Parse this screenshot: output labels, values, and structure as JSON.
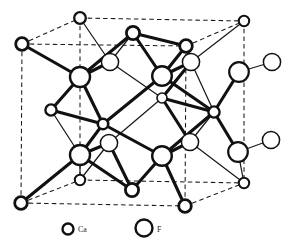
{
  "figure": {
    "background_color": "#ffffff",
    "line_color": "#1a1a1a",
    "cell_edge_style": "dashed"
  },
  "legend": {
    "items": [
      {
        "symbol": "Ca",
        "label": "Ca",
        "marker": "small-open-circle",
        "radius": 5.5,
        "stroke_width": 2.4
      },
      {
        "symbol": "F",
        "label": "F",
        "marker": "large-open-circle",
        "radius": 8.5,
        "stroke_width": 2.4
      }
    ]
  },
  "structure": {
    "cell_corners": {
      "back_top_left": {
        "x": 80,
        "y": 18
      },
      "back_top_right": {
        "x": 244,
        "y": 21
      },
      "back_bot_left": {
        "x": 80,
        "y": 180
      },
      "back_bot_right": {
        "x": 244,
        "y": 183
      },
      "front_top_left": {
        "x": 22,
        "y": 44
      },
      "front_top_right": {
        "x": 186,
        "y": 46
      },
      "front_bot_left": {
        "x": 21,
        "y": 203
      },
      "front_bot_right": {
        "x": 185,
        "y": 206
      }
    },
    "atoms_ca": [
      {
        "id": "ca-back-top-left",
        "x": 80,
        "y": 18,
        "r": 5.8,
        "w": 2.3
      },
      {
        "id": "ca-back-top-right",
        "x": 244,
        "y": 21,
        "r": 5.2,
        "w": 2.0
      },
      {
        "id": "ca-back-bot-left",
        "x": 80,
        "y": 180,
        "r": 5.2,
        "w": 2.0
      },
      {
        "id": "ca-back-bot-right",
        "x": 244,
        "y": 183,
        "r": 5.2,
        "w": 2.0
      },
      {
        "id": "ca-front-top-left",
        "x": 22,
        "y": 44,
        "r": 6.3,
        "w": 2.8
      },
      {
        "id": "ca-front-top-right",
        "x": 186,
        "y": 46,
        "r": 6.3,
        "w": 2.8
      },
      {
        "id": "ca-front-bot-left",
        "x": 21,
        "y": 203,
        "r": 6.3,
        "w": 2.8
      },
      {
        "id": "ca-front-bot-right",
        "x": 185,
        "y": 206,
        "r": 6.3,
        "w": 2.8
      },
      {
        "id": "ca-top-face",
        "x": 133,
        "y": 33,
        "r": 6.6,
        "w": 2.8
      },
      {
        "id": "ca-bot-face",
        "x": 132,
        "y": 190,
        "r": 6.6,
        "w": 2.8
      },
      {
        "id": "ca-left-face",
        "x": 51,
        "y": 110,
        "r": 5.6,
        "w": 2.4
      },
      {
        "id": "ca-right-face",
        "x": 214,
        "y": 112,
        "r": 5.6,
        "w": 2.4
      },
      {
        "id": "ca-front-face",
        "x": 103,
        "y": 124,
        "r": 5.2,
        "w": 2.6
      },
      {
        "id": "ca-back-face",
        "x": 162,
        "y": 98,
        "r": 5.0,
        "w": 1.6
      }
    ],
    "atoms_f": [
      {
        "id": "f-upper-left",
        "x": 80,
        "y": 77,
        "r": 10.0,
        "w": 2.4
      },
      {
        "id": "f-upper-mid",
        "x": 110,
        "y": 62,
        "r": 8.6,
        "w": 1.5
      },
      {
        "id": "f-upper-right",
        "x": 162,
        "y": 76,
        "r": 9.8,
        "w": 2.4
      },
      {
        "id": "f-upper-far-right",
        "x": 191,
        "y": 62,
        "r": 8.6,
        "w": 1.5
      },
      {
        "id": "f-lower-left",
        "x": 80,
        "y": 155,
        "r": 10.0,
        "w": 2.4
      },
      {
        "id": "f-lower-mid",
        "x": 109,
        "y": 143,
        "r": 8.6,
        "w": 1.5
      },
      {
        "id": "f-lower-right",
        "x": 162,
        "y": 156,
        "r": 9.8,
        "w": 2.4
      },
      {
        "id": "f-lower-far-right",
        "x": 190,
        "y": 142,
        "r": 8.6,
        "w": 1.5
      },
      {
        "id": "f-out-upper",
        "x": 239,
        "y": 72,
        "r": 9.8,
        "w": 2.2
      },
      {
        "id": "f-out-lower",
        "x": 238,
        "y": 152,
        "r": 9.8,
        "w": 2.2
      },
      {
        "id": "f-ext-upper",
        "x": 272,
        "y": 62,
        "r": 8.6,
        "w": 1.5
      },
      {
        "id": "f-ext-lower",
        "x": 271,
        "y": 140,
        "r": 8.6,
        "w": 1.5
      }
    ]
  }
}
